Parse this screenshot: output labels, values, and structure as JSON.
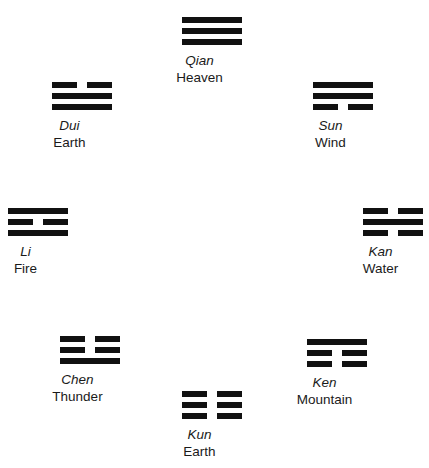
{
  "diagram": {
    "background_color": "#ffffff",
    "line_color": "#111111",
    "trigrams": [
      {
        "id": "qian",
        "name": "Qian",
        "meaning": "Heaven",
        "position": "top-center",
        "x": 182,
        "y": 17,
        "lines_top_to_bottom": [
          "solid",
          "solid",
          "solid"
        ]
      },
      {
        "id": "dui",
        "name": "Dui",
        "meaning": "Earth",
        "position": "upper-left",
        "x": 52,
        "y": 82,
        "lines_top_to_bottom": [
          "broken",
          "solid",
          "solid"
        ]
      },
      {
        "id": "sun",
        "name": "Sun",
        "meaning": "Wind",
        "position": "upper-right",
        "x": 313,
        "y": 82,
        "lines_top_to_bottom": [
          "solid",
          "solid",
          "broken"
        ]
      },
      {
        "id": "li",
        "name": "Li",
        "meaning": "Fire",
        "position": "middle-left",
        "x": 8,
        "y": 208,
        "lines_top_to_bottom": [
          "solid",
          "broken",
          "solid"
        ]
      },
      {
        "id": "kan",
        "name": "Kan",
        "meaning": "Water",
        "position": "middle-right",
        "x": 363,
        "y": 208,
        "lines_top_to_bottom": [
          "broken",
          "solid",
          "broken"
        ]
      },
      {
        "id": "chen",
        "name": "Chen",
        "meaning": "Thunder",
        "position": "lower-left",
        "x": 60,
        "y": 336,
        "lines_top_to_bottom": [
          "broken",
          "broken",
          "solid"
        ]
      },
      {
        "id": "ken",
        "name": "Ken",
        "meaning": "Mountain",
        "position": "lower-right",
        "x": 307,
        "y": 339,
        "lines_top_to_bottom": [
          "solid",
          "broken",
          "broken"
        ]
      },
      {
        "id": "kun",
        "name": "Kun",
        "meaning": "Earth",
        "position": "bottom-center",
        "x": 182,
        "y": 391,
        "lines_top_to_bottom": [
          "broken",
          "broken",
          "broken"
        ]
      }
    ]
  }
}
